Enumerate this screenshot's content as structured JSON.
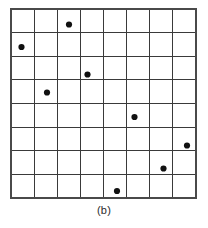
{
  "figure": {
    "caption": "(b)",
    "background_color": "#ffffff",
    "grid": {
      "rows": 8,
      "cols": 8,
      "x0": 11,
      "y0": 9,
      "x1": 196,
      "y1": 198,
      "line_color": "#3a3a3a",
      "border_color": "#4a4a4a",
      "line_width": 1
    },
    "point_style": {
      "color": "#111111",
      "radius": 3.1
    }
  },
  "chart_data": {
    "type": "scatter",
    "title": "(b)",
    "xlabel": "",
    "ylabel": "",
    "grid": true,
    "legend": "none",
    "xlim": [
      0,
      8
    ],
    "ylim": [
      0,
      8
    ],
    "categories": [
      "1",
      "2",
      "3",
      "4",
      "5",
      "6",
      "7",
      "8"
    ],
    "points": [
      {
        "row": 1,
        "col": 3,
        "cx": 69.0,
        "cy": 24.5
      },
      {
        "row": 2,
        "col": 1,
        "cx": 21.5,
        "cy": 47.0
      },
      {
        "row": 3,
        "col": 4,
        "cx": 87.5,
        "cy": 74.5
      },
      {
        "row": 4,
        "col": 2,
        "cx": 47.0,
        "cy": 92.5
      },
      {
        "row": 5,
        "col": 6,
        "cx": 134.5,
        "cy": 117.0
      },
      {
        "row": 6,
        "col": 8,
        "cx": 187.0,
        "cy": 145.5
      },
      {
        "row": 7,
        "col": 7,
        "cx": 163.5,
        "cy": 168.5
      },
      {
        "row": 8,
        "col": 5,
        "cx": 117.0,
        "cy": 191.0
      }
    ]
  }
}
